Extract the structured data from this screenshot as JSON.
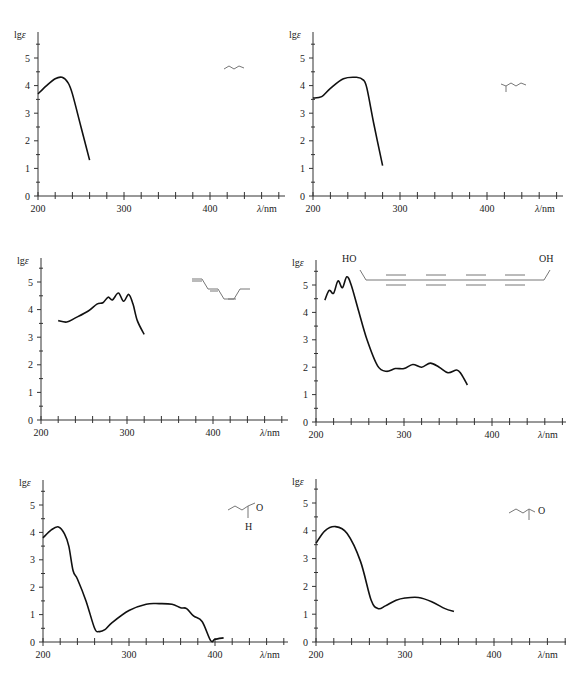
{
  "chart_data": [
    {
      "id": "c1",
      "type": "line",
      "title": "",
      "xlabel": "λ/nm",
      "ylabel": "lgε",
      "xlim": [
        200,
        480
      ],
      "ylim": [
        0,
        5.8
      ],
      "xticks": [
        "200",
        "300",
        "400"
      ],
      "yticks": [
        "0",
        "1",
        "2",
        "3",
        "4",
        "5"
      ],
      "x": [
        200,
        210,
        220,
        228,
        235,
        240,
        250,
        260
      ],
      "values": [
        3.7,
        4.0,
        4.25,
        4.3,
        4.1,
        3.7,
        2.5,
        1.3
      ],
      "structure": "conjugated diene (butadiene-like skeletal formula)"
    },
    {
      "id": "c2",
      "type": "line",
      "title": "",
      "xlabel": "λ/nm",
      "ylabel": "lgε",
      "xlim": [
        200,
        490
      ],
      "ylim": [
        0,
        5.8
      ],
      "xticks": [
        "200",
        "300",
        "400"
      ],
      "yticks": [
        "0",
        "1",
        "2",
        "3",
        "4",
        "5"
      ],
      "x": [
        200,
        210,
        220,
        235,
        250,
        258,
        262,
        270,
        280
      ],
      "values": [
        3.55,
        3.6,
        3.9,
        4.25,
        4.3,
        4.2,
        3.9,
        2.6,
        1.1
      ],
      "structure": "methyl-substituted diene skeletal formula"
    },
    {
      "id": "c3",
      "type": "line",
      "title": "",
      "xlabel": "λ/nm",
      "ylabel": "lgε",
      "xlim": [
        200,
        490
      ],
      "ylim": [
        0,
        5.8
      ],
      "xticks": [
        "200",
        "300",
        "400"
      ],
      "yticks": [
        "0",
        "1",
        "2",
        "3",
        "4",
        "5"
      ],
      "x": [
        220,
        230,
        240,
        255,
        265,
        272,
        278,
        283,
        290,
        296,
        302,
        307,
        312,
        320
      ],
      "values": [
        3.6,
        3.55,
        3.7,
        3.95,
        4.2,
        4.25,
        4.45,
        4.35,
        4.6,
        4.3,
        4.55,
        4.2,
        3.6,
        3.1
      ],
      "structure": "conjugated polyene (tetraene) skeletal formula"
    },
    {
      "id": "c4",
      "type": "line",
      "title": "",
      "xlabel": "λ/nm",
      "ylabel": "lgε",
      "xlim": [
        200,
        490
      ],
      "ylim": [
        0,
        5.8
      ],
      "xticks": [
        "200",
        "300",
        "400"
      ],
      "yticks": [
        "0",
        "1",
        "2",
        "3",
        "4",
        "5"
      ],
      "x": [
        210,
        215,
        220,
        225,
        230,
        235,
        240,
        248,
        258,
        270,
        280,
        290,
        300,
        310,
        320,
        330,
        340,
        350,
        360,
        365,
        372
      ],
      "values": [
        4.45,
        4.8,
        4.7,
        5.15,
        4.9,
        5.3,
        5.0,
        4.1,
        3.0,
        2.05,
        1.85,
        1.95,
        1.95,
        2.1,
        2.0,
        2.15,
        2.0,
        1.8,
        1.9,
        1.75,
        1.35
      ],
      "structure_labels": {
        "left": "HO",
        "right": "OH"
      },
      "structure": "HO–CH2–(C≡C)4–CH2–OH polyyne diol"
    },
    {
      "id": "c5",
      "type": "line",
      "title": "",
      "xlabel": "λ/nm",
      "ylabel": "lgε",
      "xlim": [
        200,
        480
      ],
      "ylim": [
        0,
        5.8
      ],
      "xticks": [
        "200",
        "300",
        "400"
      ],
      "yticks": [
        "0",
        "1",
        "2",
        "3",
        "4",
        "5"
      ],
      "x": [
        200,
        210,
        218,
        225,
        230,
        235,
        240,
        250,
        260,
        265,
        272,
        280,
        300,
        320,
        335,
        350,
        360,
        367,
        375,
        385,
        395,
        400,
        410
      ],
      "values": [
        3.8,
        4.1,
        4.2,
        3.95,
        3.5,
        2.6,
        2.3,
        1.5,
        0.5,
        0.38,
        0.45,
        0.7,
        1.15,
        1.38,
        1.4,
        1.38,
        1.25,
        1.22,
        0.95,
        0.75,
        0.05,
        0.1,
        0.15
      ],
      "structure_labels": {
        "o": "O",
        "h": "H"
      },
      "structure": "crotonaldehyde (α,β-unsaturated aldehyde)"
    },
    {
      "id": "c6",
      "type": "line",
      "title": "",
      "xlabel": "λ/nm",
      "ylabel": "lgε",
      "xlim": [
        200,
        490
      ],
      "ylim": [
        0,
        5.8
      ],
      "xticks": [
        "200",
        "300",
        "400"
      ],
      "yticks": [
        "0",
        "1",
        "2",
        "3",
        "4",
        "5"
      ],
      "x": [
        200,
        210,
        222,
        235,
        250,
        262,
        270,
        278,
        290,
        300,
        315,
        330,
        345,
        355
      ],
      "values": [
        3.55,
        4.0,
        4.15,
        3.9,
        2.9,
        1.5,
        1.2,
        1.3,
        1.5,
        1.58,
        1.6,
        1.45,
        1.2,
        1.1
      ],
      "structure_labels": {
        "o": "O"
      },
      "structure": "α,β-unsaturated methyl ketone (pent-3-en-2-one)"
    }
  ],
  "labels": {
    "ylabel": "lgε",
    "xlabel": "λ/nm",
    "ho": "HO",
    "oh": "OH",
    "o": "O",
    "h": "H"
  }
}
